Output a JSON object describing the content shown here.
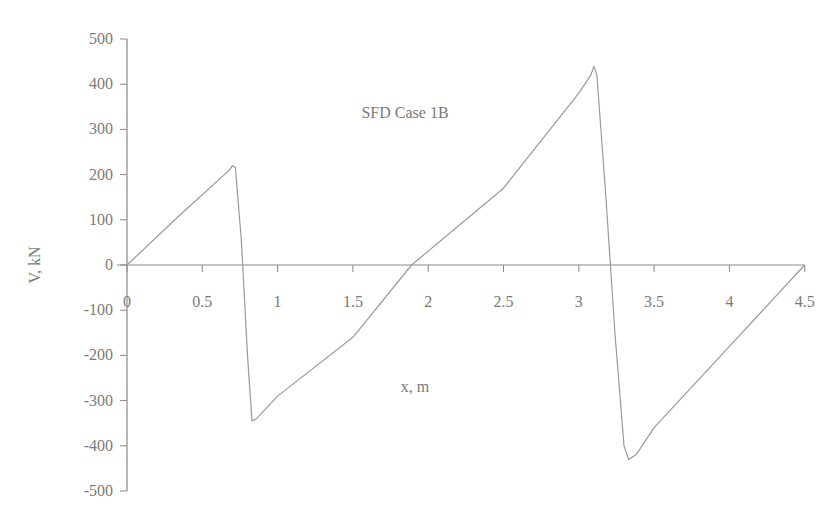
{
  "chart_data": {
    "type": "line",
    "title": "SFD Case 1B",
    "xlabel": "x, m",
    "ylabel": "V, kN",
    "xlim": [
      0,
      4.5
    ],
    "ylim": [
      -500,
      500
    ],
    "x_ticks": [
      "0",
      "0.5",
      "1",
      "1.5",
      "2",
      "2.5",
      "3",
      "3.5",
      "4",
      "4.5"
    ],
    "y_ticks": [
      "500",
      "400",
      "300",
      "200",
      "100",
      "0",
      "-100",
      "-200",
      "-300",
      "-400",
      "-500"
    ],
    "grid": false,
    "legend": null,
    "series": [
      {
        "name": "Shear force V",
        "x": [
          0,
          0.35,
          0.68,
          0.7,
          0.72,
          0.76,
          0.8,
          0.83,
          0.86,
          1.0,
          1.5,
          1.89,
          2.5,
          3.0,
          3.08,
          3.1,
          3.12,
          3.18,
          3.24,
          3.3,
          3.33,
          3.38,
          3.5,
          4.0,
          4.5
        ],
        "values": [
          0,
          110,
          210,
          220,
          215,
          50,
          -200,
          -345,
          -340,
          -290,
          -160,
          0,
          170,
          380,
          420,
          440,
          420,
          150,
          -150,
          -400,
          -430,
          -420,
          -360,
          -180,
          0
        ]
      }
    ],
    "annotations": [
      {
        "text": "SFD Case 1B",
        "x": 2.6,
        "y": 360
      }
    ]
  },
  "labels": {
    "title": "SFD Case 1B",
    "xlabel": "x, m",
    "ylabel": "V, kN"
  }
}
